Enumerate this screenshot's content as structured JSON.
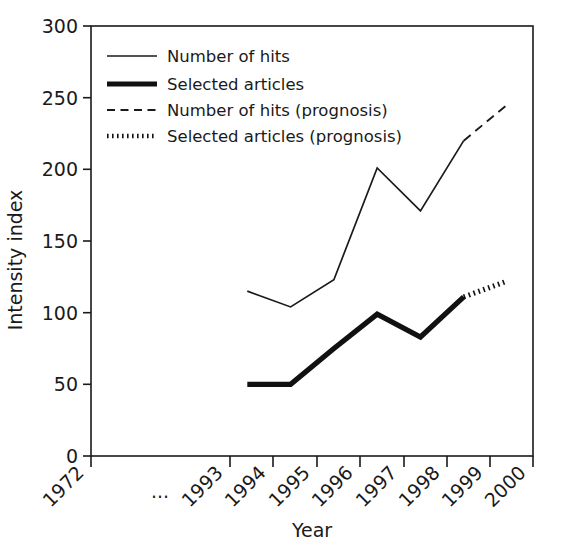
{
  "chart_data": {
    "type": "line",
    "title": "",
    "xlabel": "Year",
    "ylabel": "Intensity index",
    "ylim": [
      0,
      300
    ],
    "yticks": [
      0,
      50,
      100,
      150,
      200,
      250,
      300
    ],
    "ytick_labels": [
      "0",
      "50",
      "100",
      "150",
      "200",
      "250",
      "300"
    ],
    "xtick_labels": [
      "1972",
      "...",
      "1993",
      "1994",
      "1995",
      "1996",
      "1997",
      "1998",
      "1999",
      "2000"
    ],
    "x_axis_break": true,
    "grid": false,
    "legend_position": "top-left",
    "series": [
      {
        "name": "Number of hits",
        "style": "solid-thin",
        "x": [
          1993.4,
          1994.4,
          1995.4,
          1996.4,
          1997.4,
          1998.4
        ],
        "values": [
          115,
          104,
          123,
          201,
          171,
          220
        ]
      },
      {
        "name": "Selected articles",
        "style": "solid-thick",
        "x": [
          1993.4,
          1994.4,
          1995.4,
          1996.4,
          1997.4,
          1998.4
        ],
        "values": [
          50,
          50,
          75,
          99,
          83,
          111
        ]
      },
      {
        "name": "Number of hits (prognosis)",
        "style": "dashed-thin",
        "x": [
          1998.4,
          1999.4
        ],
        "values": [
          220,
          245
        ]
      },
      {
        "name": "Selected articles (prognosis)",
        "style": "dotted-thick",
        "x": [
          1998.4,
          1999.4
        ],
        "values": [
          111,
          122
        ]
      }
    ],
    "legend": [
      {
        "label": "Number of hits",
        "style": "solid-thin"
      },
      {
        "label": "Selected articles",
        "style": "solid-thick"
      },
      {
        "label": "Number of hits (prognosis)",
        "style": "dashed-thin"
      },
      {
        "label": "Selected articles (prognosis)",
        "style": "dotted-thick"
      }
    ],
    "colors": {
      "line": "#1a1a1a",
      "background": "#ffffff"
    }
  }
}
